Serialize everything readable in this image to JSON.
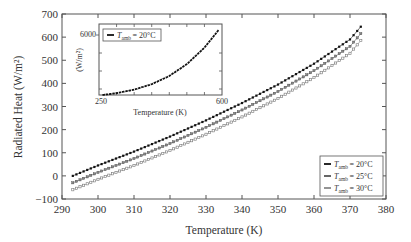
{
  "chart_data": {
    "type": "line",
    "title": "",
    "xlabel": "Temperature (K)",
    "ylabel": "Radiated Heat (W/m²)",
    "xlim": [
      290,
      380
    ],
    "ylim": [
      -100,
      700
    ],
    "xticks": [
      290,
      300,
      310,
      320,
      330,
      340,
      350,
      360,
      370,
      380
    ],
    "yticks": [
      -100,
      0,
      100,
      200,
      300,
      400,
      500,
      600,
      700
    ],
    "grid": false,
    "legend_position": "lower right",
    "x": [
      293,
      300,
      310,
      320,
      330,
      340,
      350,
      360,
      370,
      373
    ],
    "series": [
      {
        "name": "T_amb = 20°C",
        "marker": "filled",
        "color": "#111111",
        "values": [
          0,
          45,
          105,
          170,
          240,
          315,
          395,
          485,
          590,
          645
        ]
      },
      {
        "name": "T_amb = 25°C",
        "marker": "half",
        "color": "#555555",
        "values": [
          -30,
          15,
          75,
          140,
          210,
          285,
          365,
          455,
          560,
          615
        ]
      },
      {
        "name": "T_amb = 30°C",
        "marker": "open",
        "color": "#777777",
        "values": [
          -60,
          -15,
          45,
          110,
          180,
          255,
          335,
          425,
          530,
          585
        ]
      }
    ],
    "inset": {
      "type": "line",
      "xlabel": "Temperature (K)",
      "ylabel": "(W/m²)",
      "xlim": [
        250,
        600
      ],
      "xtick_labels": [
        "250",
        "600"
      ],
      "ytick_labels": [
        "6000"
      ],
      "legend": "T_amb = 20°C",
      "x": [
        260,
        300,
        350,
        400,
        450,
        500,
        550,
        590
      ],
      "values": [
        0,
        180,
        520,
        1050,
        1850,
        3000,
        4600,
        6300
      ]
    }
  },
  "labels": {
    "xlabel": "Temperature (K)",
    "ylabel": "Radiated Heat (W/m²)",
    "legend": [
      "= 20°C",
      "= 25°C",
      "= 30°C"
    ],
    "legend_T": "T",
    "legend_sub": "amb",
    "inset_xlabel": "Temperature (K)",
    "inset_ylabel": "(W/m²)",
    "inset_ytick": "6000",
    "inset_xtick_left": "250",
    "inset_xtick_right": "600",
    "inset_legend": "= 20°C"
  }
}
